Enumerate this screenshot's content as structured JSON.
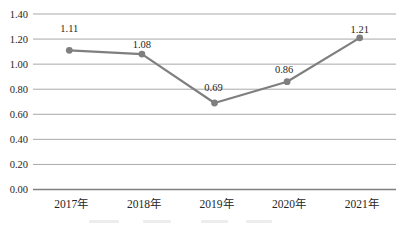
{
  "chart_data": {
    "type": "line",
    "title": "",
    "xlabel": "",
    "ylabel": "",
    "categories": [
      "2017年",
      "2018年",
      "2019年",
      "2020年",
      "2021年"
    ],
    "series": [
      {
        "name": "series-1",
        "values": [
          1.11,
          1.08,
          0.69,
          0.86,
          1.21
        ]
      }
    ],
    "data_labels": [
      "1.11",
      "1.08",
      "0.69",
      "0.86",
      "1.21"
    ],
    "y_ticks": [
      "1.40",
      "1.20",
      "1.00",
      "0.80",
      "0.60",
      "0.40",
      "0.20",
      "0.00"
    ],
    "ylim": [
      0,
      1.4
    ],
    "grid": "horizontal-only",
    "legend_position": "none",
    "colors": {
      "line": "#7f7f7f",
      "marker": "#7f7f7f",
      "gridline": "#a9a9a9",
      "baseline": "#808080",
      "text": "#262626"
    }
  }
}
